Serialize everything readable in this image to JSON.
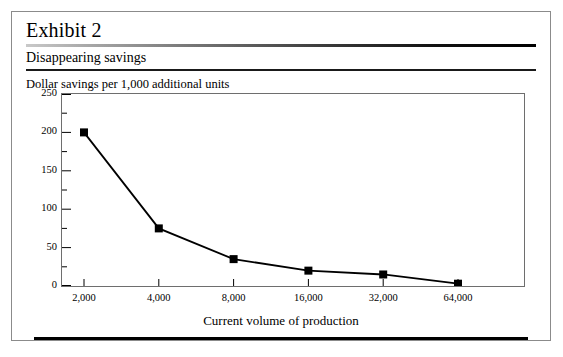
{
  "exhibit": {
    "label": "Exhibit 2",
    "subtitle": "Disappearing savings",
    "axis_note": "Dollar savings per 1,000 additional units"
  },
  "chart_data": {
    "type": "line",
    "title": "Disappearing savings",
    "subtitle": "Dollar savings per 1,000 additional units",
    "xlabel": "Current volume of production",
    "ylabel": "Dollar savings per 1,000 additional units",
    "categories": [
      "2,000",
      "4,000",
      "8,000",
      "16,000",
      "32,000",
      "64,000"
    ],
    "values": [
      200,
      75,
      35,
      20,
      15,
      3
    ],
    "ylim": [
      0,
      250
    ],
    "ytick_labels": [
      "250",
      "200",
      "150",
      "100",
      "50",
      "0"
    ],
    "ytick_values": [
      250,
      200,
      150,
      100,
      50,
      0
    ],
    "yminor_step": 25,
    "grid": false,
    "legend": "none",
    "marker": "square",
    "line_color": "#000000",
    "marker_color": "#000000"
  },
  "colors": {
    "ink": "#000000",
    "frame": "#8b8b8b",
    "rule": "#1a1a1a"
  }
}
